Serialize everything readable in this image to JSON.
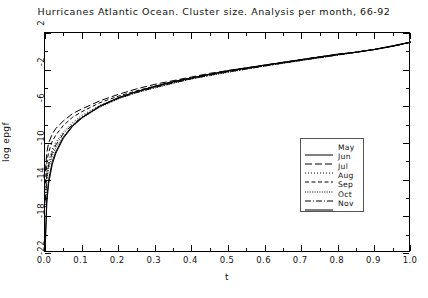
{
  "chart_data": {
    "type": "line",
    "title": "Hurricanes Atlantic Ocean. Cluster size. Analysis per month, 66-92",
    "xlabel": "t",
    "ylabel": "log epgf",
    "xlim": [
      0.0,
      1.0
    ],
    "ylim": [
      -22,
      2
    ],
    "xticks": [
      "0.0",
      "0.1",
      "0.2",
      "0.3",
      "0.4",
      "0.5",
      "0.6",
      "0.7",
      "0.8",
      "0.9",
      "1.0"
    ],
    "xtick_values": [
      0.0,
      0.1,
      0.2,
      0.3,
      0.4,
      0.5,
      0.6,
      0.7,
      0.8,
      0.9,
      1.0
    ],
    "yticks": [
      "2",
      "-2",
      "-6",
      "-10",
      "-14",
      "-18",
      "-22"
    ],
    "ytick_values": [
      2,
      -2,
      -6,
      -10,
      -14,
      -18,
      -22
    ],
    "grid": false,
    "legend_position": "lower right",
    "x": [
      0.001,
      0.005,
      0.01,
      0.02,
      0.03,
      0.05,
      0.075,
      0.1,
      0.15,
      0.2,
      0.25,
      0.3,
      0.35,
      0.4,
      0.45,
      0.5,
      0.55,
      0.6,
      0.65,
      0.7,
      0.75,
      0.8,
      0.85,
      0.9,
      0.95,
      1.0
    ],
    "series": [
      {
        "name": "May",
        "style": "solid",
        "values": [
          -21.2,
          -16.5,
          -14.4,
          -12.3,
          -11.1,
          -9.5,
          -8.2,
          -7.3,
          -6.0,
          -5.1,
          -4.4,
          -3.8,
          -3.3,
          -2.9,
          -2.5,
          -2.1,
          -1.8,
          -1.5,
          -1.2,
          -0.9,
          -0.6,
          -0.3,
          -0.1,
          0.2,
          0.6,
          1.0
        ]
      },
      {
        "name": "Jun",
        "style": "longdash",
        "values": [
          -13.1,
          -11.0,
          -10.0,
          -9.0,
          -8.4,
          -7.6,
          -6.8,
          -6.3,
          -5.4,
          -4.7,
          -4.1,
          -3.6,
          -3.2,
          -2.8,
          -2.4,
          -2.1,
          -1.8,
          -1.5,
          -1.2,
          -0.9,
          -0.6,
          -0.35,
          -0.1,
          0.2,
          0.55,
          1.0
        ]
      },
      {
        "name": "Jul",
        "style": "finedot",
        "values": [
          -15.8,
          -13.2,
          -12.0,
          -10.7,
          -9.9,
          -8.8,
          -7.8,
          -7.0,
          -5.9,
          -5.1,
          -4.4,
          -3.9,
          -3.4,
          -3.0,
          -2.6,
          -2.2,
          -1.9,
          -1.6,
          -1.3,
          -1.0,
          -0.7,
          -0.4,
          -0.1,
          0.2,
          0.55,
          1.0
        ]
      },
      {
        "name": "Aug",
        "style": "dash",
        "values": [
          -14.4,
          -12.1,
          -11.0,
          -9.8,
          -9.1,
          -8.1,
          -7.2,
          -6.6,
          -5.6,
          -4.9,
          -4.3,
          -3.8,
          -3.3,
          -2.9,
          -2.5,
          -2.2,
          -1.85,
          -1.55,
          -1.25,
          -0.95,
          -0.65,
          -0.38,
          -0.1,
          0.2,
          0.55,
          1.0
        ]
      },
      {
        "name": "Sep",
        "style": "dot",
        "values": [
          -17.0,
          -14.1,
          -12.8,
          -11.4,
          -10.5,
          -9.3,
          -8.2,
          -7.3,
          -6.1,
          -5.2,
          -4.5,
          -4.0,
          -3.5,
          -3.0,
          -2.65,
          -2.3,
          -1.95,
          -1.6,
          -1.3,
          -1.0,
          -0.7,
          -0.4,
          -0.1,
          0.2,
          0.55,
          1.0
        ]
      },
      {
        "name": "Oct",
        "style": "dashdot",
        "values": [
          -16.3,
          -13.6,
          -12.4,
          -11.0,
          -10.2,
          -9.0,
          -8.0,
          -7.2,
          -6.0,
          -5.15,
          -4.5,
          -3.95,
          -3.45,
          -3.0,
          -2.6,
          -2.25,
          -1.92,
          -1.6,
          -1.28,
          -0.98,
          -0.68,
          -0.4,
          -0.1,
          0.2,
          0.55,
          1.0
        ]
      },
      {
        "name": "Nov",
        "style": "solid",
        "values": [
          -20.3,
          -16.0,
          -14.0,
          -12.0,
          -10.9,
          -9.4,
          -8.1,
          -7.25,
          -5.95,
          -5.05,
          -4.4,
          -3.85,
          -3.35,
          -2.92,
          -2.52,
          -2.15,
          -1.85,
          -1.52,
          -1.22,
          -0.92,
          -0.62,
          -0.33,
          -0.08,
          0.22,
          0.6,
          1.02
        ]
      }
    ]
  },
  "legend": {
    "entries": [
      {
        "label": "May"
      },
      {
        "label": "Jun"
      },
      {
        "label": "Jul"
      },
      {
        "label": "Aug"
      },
      {
        "label": "Sep"
      },
      {
        "label": "Oct"
      },
      {
        "label": "Nov"
      }
    ]
  },
  "colors": {
    "line": "#000000",
    "axis": "#000000",
    "background": "#ffffff",
    "legend_border": "#555555"
  }
}
